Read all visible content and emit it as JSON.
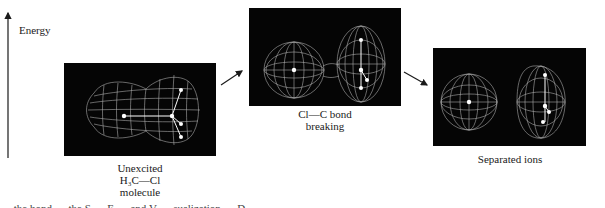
{
  "axis": {
    "label": "Energy",
    "direction": "up",
    "icon": "arrow-up-icon"
  },
  "stages": [
    {
      "id": "unexcited",
      "caption_lines": [
        "Unexcited",
        "H₃C—Cl",
        "molecule"
      ],
      "image": "wireframe-electron-density-molecule",
      "description": "Peanut-shaped electron cloud enclosing Cl atom and methyl group"
    },
    {
      "id": "bond-breaking",
      "caption_lines": [
        "Cl—C bond",
        "breaking"
      ],
      "image": "wireframe-electron-density-bond-breaking",
      "description": "Two lobes joined by a narrow neck as the Cl—C bond stretches"
    },
    {
      "id": "separated",
      "caption_lines": [
        "Separated ions"
      ],
      "image": "wireframe-electron-density-separated-ions",
      "description": "Spherical chloride ion and elongated methyl cation cloud, separated"
    }
  ],
  "arrows": [
    {
      "from": "unexcited",
      "to": "bond-breaking",
      "icon": "arrow-up-right-icon"
    },
    {
      "from": "bond-breaking",
      "to": "separated",
      "icon": "arrow-down-right-icon"
    }
  ],
  "colors": {
    "panel_background": "#050505",
    "wireframe": "#bdbdbd",
    "atoms": "#ffffff",
    "text": "#1a1a1a"
  },
  "figure_caption_partial": "… the bond … the S … E … and V … sualization … D …"
}
